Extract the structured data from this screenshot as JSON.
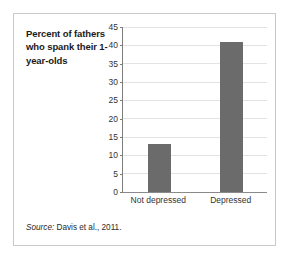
{
  "figure": {
    "title": "Percent of fathers who spank their 1-year-olds",
    "source_label": "Source:",
    "source_text": "Davis et al., 2011.",
    "border_color": "#c9c9c9",
    "bar_color": "#6b6b6b",
    "grid_color": "#e3e3e3",
    "axis_color": "#7d7d7d"
  },
  "chart_data": {
    "type": "bar",
    "title": "Percent of fathers who spank their 1-year-olds",
    "categories": [
      "Not depressed",
      "Depressed"
    ],
    "values": [
      13,
      41
    ],
    "xlabel": "",
    "ylabel": "",
    "ylim": [
      0,
      45
    ],
    "yticks": [
      0,
      5,
      10,
      15,
      20,
      25,
      30,
      35,
      40,
      45
    ],
    "ytick_labels": [
      "0",
      "5",
      "10",
      "15",
      "20",
      "25",
      "30",
      "35",
      "40",
      "45"
    ],
    "grid": true,
    "grid_axis": "y",
    "legend": false,
    "annotation": "Source: Davis et al., 2011."
  }
}
